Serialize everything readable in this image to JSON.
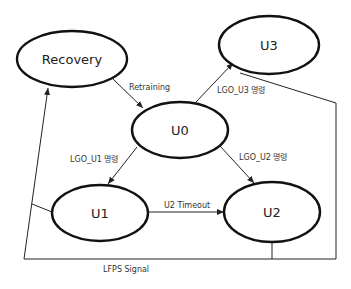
{
  "diagram": {
    "type": "state-diagram",
    "nodes": [
      {
        "id": "recovery",
        "label": "Recovery"
      },
      {
        "id": "u0",
        "label": "U0"
      },
      {
        "id": "u1",
        "label": "U1"
      },
      {
        "id": "u2",
        "label": "U2"
      },
      {
        "id": "u3",
        "label": "U3"
      }
    ],
    "edges": [
      {
        "from": "recovery",
        "to": "u0",
        "label": "Retraining"
      },
      {
        "from": "u0",
        "to": "u3",
        "label": "LGO_U3 명령"
      },
      {
        "from": "u0",
        "to": "u1",
        "label": "LGO_U1 명령"
      },
      {
        "from": "u0",
        "to": "u2",
        "label": "LGO_U2 명령"
      },
      {
        "from": "u1",
        "to": "u2",
        "label": "U2 Timeout"
      },
      {
        "from": "u1,u2,u3",
        "to": "recovery",
        "label": "LFPS Signal"
      }
    ]
  }
}
